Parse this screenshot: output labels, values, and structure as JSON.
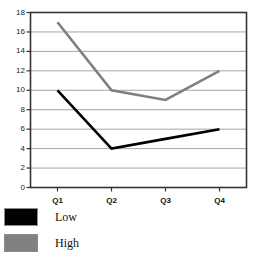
{
  "chart_data": {
    "type": "line",
    "title": "",
    "xlabel": "",
    "ylabel": "",
    "categories": [
      "Q1",
      "Q2",
      "Q3",
      "Q4"
    ],
    "series": [
      {
        "name": "Low",
        "color": "#000000",
        "values": [
          10,
          4,
          5,
          6
        ]
      },
      {
        "name": "High",
        "color": "#808080",
        "values": [
          17,
          10,
          9,
          12
        ]
      }
    ],
    "ylim": [
      0,
      18
    ],
    "ytick_step": 2,
    "yticks": [
      0,
      2,
      4,
      6,
      8,
      10,
      12,
      14,
      16,
      18
    ],
    "ytick_labels": [
      "0",
      "2",
      "4",
      "6",
      "8",
      "10",
      "12",
      "14",
      "16",
      "18"
    ],
    "grid": true,
    "grid_axis": "y",
    "legend_position": "bottom-left",
    "plot_border": true
  },
  "legend": {
    "entries": [
      {
        "label": "Low",
        "color": "#000000"
      },
      {
        "label": "High",
        "color": "#808080"
      }
    ]
  },
  "colors": {
    "low": "#000000",
    "high": "#808080",
    "grid": "#a6a6a6",
    "border": "#333333",
    "text": "#111111"
  }
}
